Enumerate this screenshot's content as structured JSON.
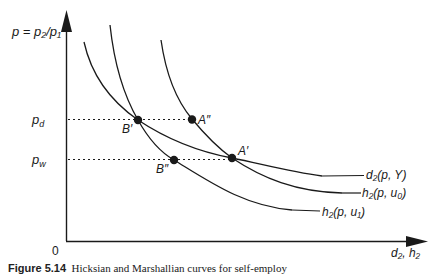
{
  "diagram": {
    "y_axis_label": "p = p₂/p₁",
    "x_axis_label": "d₂, h₂",
    "origin_label": "0",
    "price_levels": [
      {
        "id": "pd",
        "label": "p_d",
        "base": "p",
        "sub": "d"
      },
      {
        "id": "pw",
        "label": "p_w",
        "base": "p",
        "sub": "w"
      }
    ],
    "points": [
      {
        "id": "B1",
        "label": "B′"
      },
      {
        "id": "A2",
        "label": "A″"
      },
      {
        "id": "A1",
        "label": "A′"
      },
      {
        "id": "B2",
        "label": "B″"
      }
    ],
    "curves": [
      {
        "id": "d2",
        "label": "d₂(p, Y)"
      },
      {
        "id": "h2u0",
        "label": "h₂(p, u₀)"
      },
      {
        "id": "h2u1",
        "label": "h₂(p, u₁)"
      }
    ],
    "colors": {
      "ink": "#1a1a1a",
      "background": "#ffffff"
    }
  },
  "caption": {
    "prefix": "Figure 5.14",
    "text": "Hicksian and Marshallian curves for self-employ"
  }
}
